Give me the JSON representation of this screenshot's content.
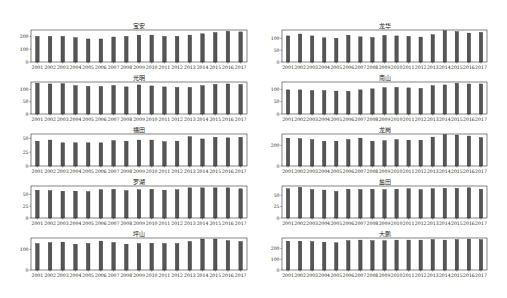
{
  "figure": {
    "bar_color": "#555555",
    "edge_color": "#333333",
    "background": "#ffffff"
  },
  "chart_data": [
    {
      "type": "bar",
      "title": "宝安",
      "position": "row-1-left",
      "categories": [
        "2001",
        "2002",
        "2003",
        "2004",
        "2005",
        "2006",
        "2007",
        "2008",
        "2009",
        "2010",
        "2011",
        "2012",
        "2013",
        "2014",
        "2015",
        "2016",
        "2017"
      ],
      "values": [
        200,
        200,
        200,
        190,
        180,
        180,
        195,
        200,
        210,
        210,
        200,
        200,
        210,
        220,
        230,
        240,
        235
      ],
      "yticks": [
        0,
        100,
        200
      ],
      "ylim": [
        0,
        250
      ],
      "xlabel": "",
      "ylabel": "",
      "grid": false,
      "legend": "none"
    },
    {
      "type": "bar",
      "title": "龙华",
      "position": "row-1-right",
      "categories": [
        "2001",
        "2002",
        "2003",
        "2004",
        "2005",
        "2006",
        "2007",
        "2008",
        "2009",
        "2010",
        "2011",
        "2012",
        "2013",
        "2014",
        "2015",
        "2016",
        "2017"
      ],
      "values": [
        110,
        118,
        110,
        102,
        100,
        113,
        106,
        103,
        112,
        110,
        108,
        105,
        115,
        132,
        128,
        122,
        125
      ],
      "yticks": [
        0,
        50,
        100
      ],
      "ylim": [
        0,
        135
      ],
      "xlabel": "",
      "ylabel": "",
      "grid": false,
      "legend": "none"
    },
    {
      "type": "bar",
      "title": "光明",
      "position": "row-2-left",
      "categories": [
        "2001",
        "2002",
        "2003",
        "2004",
        "2005",
        "2006",
        "2007",
        "2008",
        "2009",
        "2010",
        "2011",
        "2012",
        "2013",
        "2014",
        "2015",
        "2016",
        "2017"
      ],
      "values": [
        125,
        122,
        123,
        115,
        112,
        112,
        116,
        110,
        118,
        114,
        110,
        108,
        108,
        115,
        120,
        122,
        120
      ],
      "yticks": [
        0,
        50,
        100
      ],
      "ylim": [
        0,
        130
      ],
      "xlabel": "",
      "ylabel": "",
      "grid": false,
      "legend": "none"
    },
    {
      "type": "bar",
      "title": "南山",
      "position": "row-2-right",
      "categories": [
        "2001",
        "2002",
        "2003",
        "2004",
        "2005",
        "2006",
        "2007",
        "2008",
        "2009",
        "2010",
        "2011",
        "2012",
        "2013",
        "2014",
        "2015",
        "2016",
        "2017"
      ],
      "values": [
        98,
        98,
        95,
        95,
        93,
        92,
        98,
        102,
        107,
        108,
        106,
        104,
        115,
        118,
        125,
        122,
        122
      ],
      "yticks": [
        0,
        50,
        100
      ],
      "ylim": [
        0,
        130
      ],
      "xlabel": "",
      "ylabel": "",
      "grid": false,
      "legend": "none"
    },
    {
      "type": "bar",
      "title": "福田",
      "position": "row-3-left",
      "categories": [
        "2001",
        "2002",
        "2003",
        "2004",
        "2005",
        "2006",
        "2007",
        "2008",
        "2009",
        "2010",
        "2011",
        "2012",
        "2013",
        "2014",
        "2015",
        "2016",
        "2017"
      ],
      "values": [
        45,
        47,
        42,
        42,
        42,
        42,
        46,
        45,
        47,
        47,
        44,
        45,
        53,
        49,
        52,
        51,
        52
      ],
      "yticks": [
        0,
        25,
        50
      ],
      "ylim": [
        0,
        58
      ],
      "xlabel": "",
      "ylabel": "",
      "grid": false,
      "legend": "none"
    },
    {
      "type": "bar",
      "title": "龙岗",
      "position": "row-3-right",
      "categories": [
        "2001",
        "2002",
        "2003",
        "2004",
        "2005",
        "2006",
        "2007",
        "2008",
        "2009",
        "2010",
        "2011",
        "2012",
        "2013",
        "2014",
        "2015",
        "2016",
        "2017"
      ],
      "values": [
        270,
        265,
        255,
        240,
        240,
        255,
        270,
        240,
        245,
        255,
        250,
        250,
        280,
        305,
        300,
        290,
        275
      ],
      "yticks": [
        0,
        200
      ],
      "ylim": [
        0,
        310
      ],
      "xlabel": "",
      "ylabel": "",
      "grid": false,
      "legend": "none"
    },
    {
      "type": "bar",
      "title": "罗湖",
      "position": "row-4-left",
      "categories": [
        "2001",
        "2002",
        "2003",
        "2004",
        "2005",
        "2006",
        "2007",
        "2008",
        "2009",
        "2010",
        "2011",
        "2012",
        "2013",
        "2014",
        "2015",
        "2016",
        "2017"
      ],
      "values": [
        59,
        58,
        57,
        57,
        56,
        60,
        61,
        58,
        60,
        61,
        59,
        60,
        64,
        64,
        64,
        64,
        62
      ],
      "yticks": [
        0,
        25,
        50
      ],
      "ylim": [
        0,
        68
      ],
      "xlabel": "",
      "ylabel": "",
      "grid": false,
      "legend": "none"
    },
    {
      "type": "bar",
      "title": "盐田",
      "position": "row-4-right",
      "categories": [
        "2001",
        "2002",
        "2003",
        "2004",
        "2005",
        "2006",
        "2007",
        "2008",
        "2009",
        "2010",
        "2011",
        "2012",
        "2013",
        "2014",
        "2015",
        "2016",
        "2017"
      ],
      "values": [
        64,
        67,
        62,
        61,
        58,
        63,
        62,
        63,
        62,
        63,
        64,
        62,
        64,
        65,
        65,
        66,
        63
      ],
      "yticks": [
        0,
        25,
        50
      ],
      "ylim": [
        0,
        70
      ],
      "xlabel": "",
      "ylabel": "",
      "grid": false,
      "legend": "none"
    },
    {
      "type": "bar",
      "title": "坪山",
      "position": "row-5-left",
      "categories": [
        "2001",
        "2002",
        "2003",
        "2004",
        "2005",
        "2006",
        "2007",
        "2008",
        "2009",
        "2010",
        "2011",
        "2012",
        "2013",
        "2014",
        "2015",
        "2016",
        "2017"
      ],
      "values": [
        128,
        132,
        135,
        125,
        128,
        140,
        133,
        125,
        128,
        130,
        128,
        128,
        138,
        150,
        150,
        142,
        138
      ],
      "yticks": [
        0,
        100
      ],
      "ylim": [
        0,
        155
      ],
      "xlabel": "",
      "ylabel": "",
      "grid": false,
      "legend": "none"
    },
    {
      "type": "bar",
      "title": "大鹏",
      "position": "row-5-right",
      "categories": [
        "2001",
        "2002",
        "2003",
        "2004",
        "2005",
        "2006",
        "2007",
        "2008",
        "2009",
        "2010",
        "2011",
        "2012",
        "2013",
        "2014",
        "2015",
        "2016",
        "2017"
      ],
      "values": [
        270,
        270,
        265,
        260,
        255,
        275,
        280,
        275,
        275,
        280,
        280,
        280,
        285,
        280,
        285,
        290,
        285
      ],
      "yticks": [
        0,
        100,
        200
      ],
      "ylim": [
        0,
        300
      ],
      "xlabel": "",
      "ylabel": "",
      "grid": false,
      "legend": "none"
    }
  ]
}
